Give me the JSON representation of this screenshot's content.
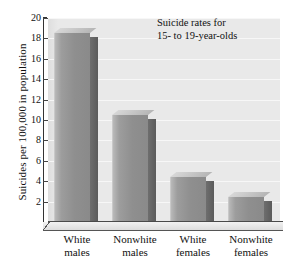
{
  "chart_data": {
    "type": "bar",
    "title": "",
    "annotation": [
      "Suicide rates for",
      "15- to 19-year-olds"
    ],
    "categories": [
      "White males",
      "Nonwhite males",
      "White females",
      "Nonwhite females"
    ],
    "category_lines": [
      [
        "White",
        "males"
      ],
      [
        "Nonwhite",
        "males"
      ],
      [
        "White",
        "females"
      ],
      [
        "Nonwhite",
        "females"
      ]
    ],
    "values": [
      18.5,
      10.5,
      4.4,
      2.5
    ],
    "xlabel": "",
    "ylabel": "Suicides per 100,000 in population",
    "ylim": [
      0,
      20
    ],
    "ytick_step": 2,
    "yticks": [
      20,
      18,
      16,
      14,
      12,
      10,
      8,
      6,
      4,
      2
    ],
    "grid": true,
    "legend": "none",
    "style": "3d-bar-grayscale",
    "colors": {
      "bar_front_light": "#b9b9b9",
      "bar_front_dark": "#8a8a8a",
      "bar_side": "#5b5b5b",
      "bar_top": "#c6c6c6",
      "plot_background": "#e9e9e9",
      "gridline": "#f7f7f7",
      "axis": "#333333",
      "text": "#111111",
      "page_background": "#ffffff"
    }
  }
}
